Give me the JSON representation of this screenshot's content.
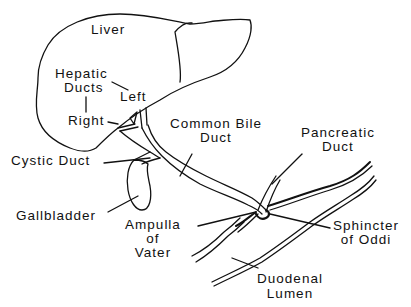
{
  "diagram": {
    "colors": {
      "ink": "#111111",
      "background": "#ffffff"
    },
    "labels": {
      "liver": "Liver",
      "hepatic_ducts": [
        "Hepatic",
        "Ducts"
      ],
      "left": "Left",
      "right": "Right",
      "common_bile_duct": [
        "Common Bile",
        "Duct"
      ],
      "pancreatic_duct": [
        "Pancreatic",
        "Duct"
      ],
      "cystic_duct": "Cystic Duct",
      "gallbladder": "Gallbladder",
      "ampulla_of_vater": [
        "Ampulla",
        "of",
        "Vater"
      ],
      "sphincter_of_oddi": [
        "Sphincter",
        "of Oddi"
      ],
      "duodenal_lumen": [
        "Duodenal",
        "Lumen"
      ]
    }
  }
}
